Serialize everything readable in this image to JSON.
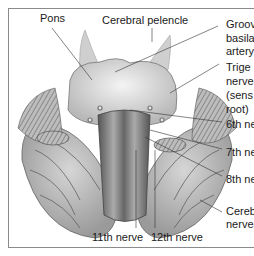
{
  "figure": {
    "labels": {
      "pons": "Pons",
      "cerebral_peduncle": "Cerebral pelencle",
      "groove_basilar_line1": "Groov",
      "groove_basilar_line2": "basila",
      "groove_basilar_line3": "artery",
      "trigeminal_line1": "Trige",
      "trigeminal_line2": "nerve",
      "trigeminal_line3": "(sens",
      "trigeminal_line4": "root)",
      "sixth_nerve": "6th ne",
      "seventh_nerve": "7th ne",
      "eighth_nerve": "8th ne",
      "cerebellar_line1": "Cereb",
      "cerebellar_line2": "nerve",
      "eleventh_nerve": "11th nerve",
      "twelfth_nerve": "12th nerve"
    }
  }
}
